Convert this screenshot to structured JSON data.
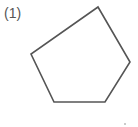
{
  "figure": {
    "label": "(1)",
    "shape": "pentagon",
    "stroke_color": "#555555",
    "fill_color": "none",
    "vertices": [
      [
        98,
        7
      ],
      [
        130,
        62
      ],
      [
        105,
        102
      ],
      [
        54,
        102
      ],
      [
        31,
        54
      ]
    ],
    "stray_mark": [
      125,
      124
    ]
  }
}
